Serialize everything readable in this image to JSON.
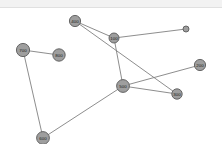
{
  "header": {
    "strip_color": "#f2f2f2"
  },
  "canvas": {
    "background": "#ffffff",
    "node_fill": "#9e9e9e",
    "node_stroke": "#5a5a5a",
    "edge_color": "#808080",
    "label_color": "#1a1a1a"
  },
  "chart_data": {
    "type": "diagram",
    "title": "",
    "xlabel": "",
    "ylabel": "",
    "layout": "node-link graph",
    "nodes": [
      {
        "id": "0",
        "label": "0",
        "x": 186,
        "y": 21,
        "r": 3.0
      },
      {
        "id": "100",
        "label": "100",
        "x": 114,
        "y": 30,
        "r": 5.0
      },
      {
        "id": "200",
        "label": "200",
        "x": 200,
        "y": 57,
        "r": 5.6
      },
      {
        "id": "300",
        "label": "300",
        "x": 177,
        "y": 86,
        "r": 5.2
      },
      {
        "id": "400",
        "label": "400",
        "x": 75,
        "y": 13,
        "r": 5.6
      },
      {
        "id": "500",
        "label": "500",
        "x": 123,
        "y": 78,
        "r": 6.4
      },
      {
        "id": "600",
        "label": "600",
        "x": 43,
        "y": 130,
        "r": 6.4
      },
      {
        "id": "700",
        "label": "700",
        "x": 23,
        "y": 42,
        "r": 6.6
      },
      {
        "id": "800",
        "label": "800",
        "x": 59,
        "y": 47,
        "r": 6.2
      }
    ],
    "edges": [
      {
        "source": "400",
        "target": "100"
      },
      {
        "source": "400",
        "target": "300"
      },
      {
        "source": "100",
        "target": "0"
      },
      {
        "source": "500",
        "target": "200"
      },
      {
        "source": "500",
        "target": "100"
      },
      {
        "source": "500",
        "target": "300"
      },
      {
        "source": "500",
        "target": "600"
      },
      {
        "source": "700",
        "target": "800"
      },
      {
        "source": "700",
        "target": "600"
      }
    ]
  }
}
